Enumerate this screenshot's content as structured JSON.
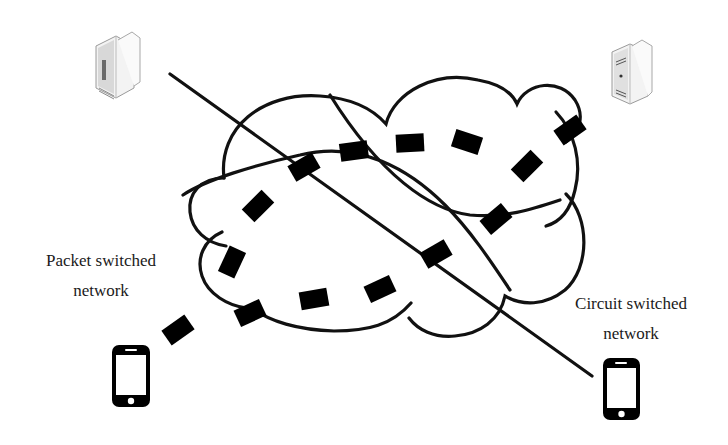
{
  "diagram": {
    "type": "network-comparison",
    "labels": {
      "packet": {
        "line1": "Packet switched",
        "line2": "network"
      },
      "circuit": {
        "line1": "Circuit switched",
        "line2": "network"
      }
    },
    "nodes": [
      {
        "id": "server-left",
        "icon": "server-icon"
      },
      {
        "id": "server-right",
        "icon": "server-icon"
      },
      {
        "id": "phone-left",
        "icon": "smartphone-icon"
      },
      {
        "id": "phone-right",
        "icon": "smartphone-icon"
      }
    ],
    "elements": {
      "cloud": "network-cloud",
      "divider": "diagonal-divider-line",
      "paths": [
        "dashed-path-upper",
        "dashed-path-lower"
      ]
    },
    "colors": {
      "stroke": "#111111",
      "background": "#ffffff",
      "server_body": "#f2f2f2",
      "server_shade": "#bdbdbd"
    }
  }
}
